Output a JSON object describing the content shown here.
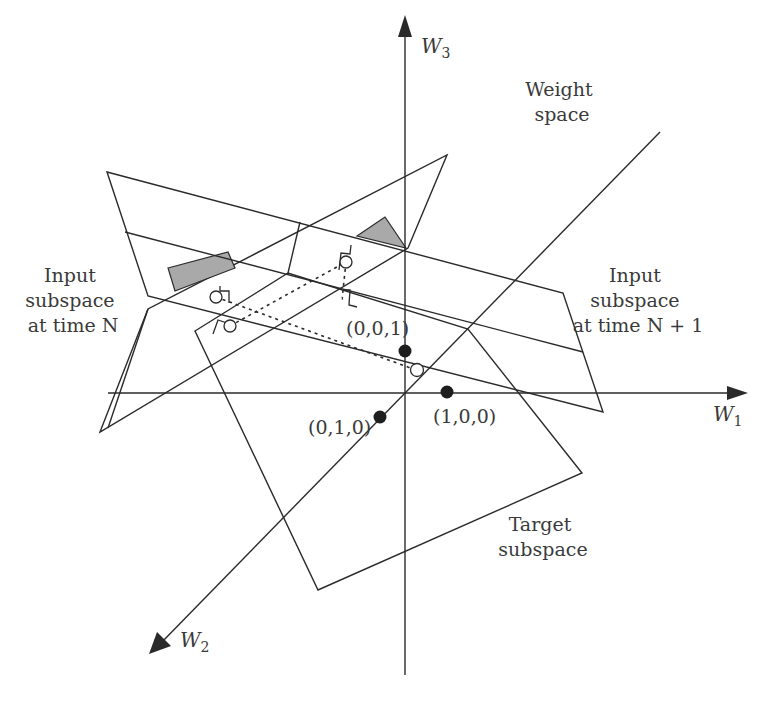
{
  "diagram": {
    "axes": {
      "w1": {
        "name": "W",
        "subscript": "1"
      },
      "w2": {
        "name": "W",
        "subscript": "2"
      },
      "w3": {
        "name": "W",
        "subscript": "3"
      }
    },
    "labels": {
      "weight_space": [
        "Weight",
        "space"
      ],
      "input_subspace_n": [
        "Input",
        "subspace",
        "at time N"
      ],
      "input_subspace_n1": [
        "Input",
        "subspace",
        "at time N + 1"
      ],
      "target_subspace": [
        "Target",
        "subspace"
      ]
    },
    "points": [
      {
        "label": "(0,0,1)",
        "kind": "filled"
      },
      {
        "label": "(1,0,0)",
        "kind": "filled"
      },
      {
        "label": "(0,1,0)",
        "kind": "filled"
      }
    ],
    "colors": {
      "target_fill": "#a9a9a9",
      "ink": "#2a2a2a",
      "text": "#3a3a3a",
      "background": "#ffffff"
    }
  }
}
